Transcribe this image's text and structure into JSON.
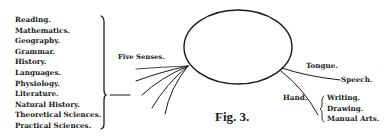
{
  "figure": {
    "caption": "Fig. 3.",
    "subjects": [
      "Reading.",
      "Mathematics.",
      "Geography.",
      "Grammar.",
      "History.",
      "Languages.",
      "Physiology.",
      "Literature.",
      "Natural History.",
      "Theoretical Sciences.",
      "Practical Sciences."
    ],
    "senses_label": "Five Senses.",
    "tongue_label": "Tongue.",
    "speech_label": "Speech.",
    "hand_label": "Hand.",
    "hand_outputs": [
      "Writing.",
      "Drawing.",
      "Manual Arts."
    ]
  }
}
